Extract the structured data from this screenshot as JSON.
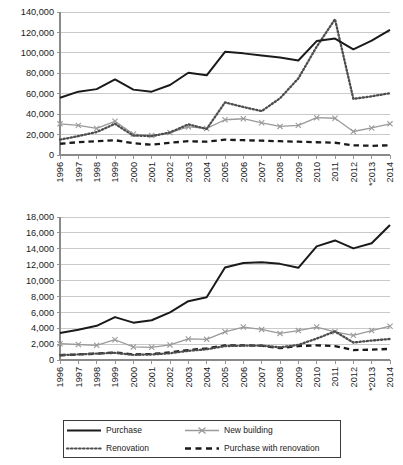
{
  "chart_data": [
    {
      "type": "line",
      "id": "top-chart",
      "title": "",
      "xlabel": "",
      "ylabel": "",
      "x": [
        "1996",
        "1997",
        "1998",
        "1999",
        "2000",
        "2001",
        "2002",
        "2003",
        "2004",
        "2005",
        "2006",
        "2007",
        "2008",
        "2009",
        "2010",
        "2011",
        "2012",
        "*2013",
        "2014"
      ],
      "xtick_labels": [
        "1996",
        "1997",
        "1998",
        "1999",
        "2000",
        "2001",
        "2002",
        "2003",
        "2004",
        "2005",
        "2006",
        "2007",
        "2008",
        "2009",
        "2010",
        "2011",
        "2012",
        "*2013",
        "2014"
      ],
      "ytick_labels": [
        "0",
        "20,000",
        "40,000",
        "60,000",
        "80,000",
        "100,000",
        "120,000",
        "140,000"
      ],
      "ylim": [
        0,
        140000
      ],
      "ytick_step": 20000,
      "grid": true,
      "legend_position": "bottom",
      "series": [
        {
          "name": "Purchase",
          "values": [
            56000,
            62000,
            64500,
            74000,
            64000,
            62000,
            68500,
            80500,
            78000,
            101000,
            99500,
            97500,
            95500,
            92500,
            111500,
            114000,
            103500,
            112000,
            122500
          ]
        },
        {
          "name": "Renovation",
          "values": [
            15000,
            18500,
            22500,
            30500,
            19000,
            18500,
            22000,
            30000,
            25500,
            51500,
            47000,
            43000,
            55500,
            75000,
            106000,
            133000,
            55000,
            57500,
            60500
          ]
        },
        {
          "name": "New building",
          "values": [
            30500,
            29000,
            26000,
            33000,
            20500,
            19000,
            22000,
            27500,
            26000,
            34500,
            35500,
            31500,
            28000,
            29000,
            36500,
            36000,
            23000,
            26500,
            30500
          ]
        },
        {
          "name": "Purchase with renovation",
          "values": [
            11000,
            12500,
            13500,
            14500,
            11500,
            10000,
            12000,
            13500,
            13000,
            15000,
            14500,
            14000,
            13500,
            13000,
            12500,
            12000,
            9500,
            9000,
            9500
          ]
        }
      ]
    },
    {
      "type": "line",
      "id": "bottom-chart",
      "title": "",
      "xlabel": "",
      "ylabel": "",
      "x": [
        "1996",
        "1997",
        "1998",
        "1999",
        "2000",
        "2001",
        "2002",
        "2003",
        "2004",
        "2005",
        "2006",
        "2007",
        "2008",
        "2009",
        "2010",
        "2011",
        "2012",
        "*2013",
        "2014"
      ],
      "xtick_labels": [
        "1996",
        "1997",
        "1998",
        "1999",
        "2000",
        "2001",
        "2002",
        "2003",
        "2004",
        "2005",
        "2006",
        "2007",
        "2008",
        "2009",
        "2010",
        "2011",
        "2012",
        "*2013",
        "2014"
      ],
      "ytick_labels": [
        "0",
        "2,000",
        "4,000",
        "6,000",
        "8,000",
        "10,000",
        "12,000",
        "14,000",
        "16,000",
        "18,000"
      ],
      "ylim": [
        0,
        18000
      ],
      "ytick_step": 2000,
      "grid": true,
      "legend_position": "bottom",
      "series": [
        {
          "name": "Purchase",
          "values": [
            3400,
            3800,
            4300,
            5400,
            4700,
            5000,
            6000,
            7400,
            7900,
            11650,
            12200,
            12300,
            12100,
            11600,
            14300,
            15050,
            14050,
            14700,
            17000
          ]
        },
        {
          "name": "Renovation",
          "values": [
            620,
            700,
            800,
            900,
            650,
            700,
            850,
            1150,
            1350,
            1750,
            1800,
            1800,
            1600,
            1900,
            2700,
            3600,
            2200,
            2450,
            2650
          ]
        },
        {
          "name": "New building",
          "values": [
            2050,
            1950,
            1850,
            2550,
            1650,
            1600,
            1900,
            2650,
            2600,
            3550,
            4150,
            3850,
            3350,
            3700,
            4150,
            3550,
            3100,
            3700,
            4250
          ]
        },
        {
          "name": "Purchase with renovation",
          "values": [
            600,
            700,
            800,
            950,
            700,
            750,
            950,
            1250,
            1450,
            1850,
            1850,
            1800,
            1500,
            1750,
            1850,
            1750,
            1250,
            1300,
            1400
          ]
        }
      ]
    }
  ],
  "legend": {
    "items": [
      {
        "label": "Purchase",
        "style": "solid-black",
        "color": "#1a1a1a"
      },
      {
        "label": "New building",
        "style": "solid-gray-x",
        "color": "#9a9a9a"
      },
      {
        "label": "Renovation",
        "style": "dotted-dark",
        "color": "#4d4d4d"
      },
      {
        "label": "Purchase with renovation",
        "style": "dashed-black",
        "color": "#1a1a1a"
      }
    ]
  },
  "colors": {
    "purchase": "#1a1a1a",
    "renovation": "#4d4d4d",
    "new_building": "#9a9a9a",
    "purchase_with_renovation": "#1a1a1a",
    "grid": "#bdbdbd",
    "axis": "#8a8a8a",
    "text": "#1a1a1a"
  }
}
